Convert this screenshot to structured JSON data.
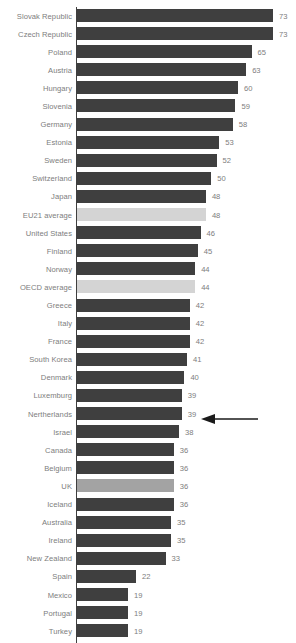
{
  "chart_data": {
    "type": "bar",
    "orientation": "horizontal",
    "title": "",
    "subtitle": "",
    "xlabel": "",
    "ylabel": "",
    "xlim": [
      0,
      73
    ],
    "grid": false,
    "legend": null,
    "categories": [
      "Slovak Republic",
      "Czech Republic",
      "Poland",
      "Austria",
      "Hungary",
      "Slovenia",
      "Germany",
      "Estonia",
      "Sweden",
      "Switzerland",
      "Japan",
      "EU21 average",
      "United States",
      "Finland",
      "Norway",
      "OECD average",
      "Greece",
      "Italy",
      "France",
      "South Korea",
      "Denmark",
      "Luxemburg",
      "Nertherlands",
      "Israel",
      "Canada",
      "Belgium",
      "UK",
      "Iceland",
      "Australia",
      "Ireland",
      "New Zealand",
      "Spain",
      "Mexico",
      "Portugal",
      "Turkey"
    ],
    "values": [
      73,
      73,
      65,
      63,
      60,
      59,
      58,
      53,
      52,
      50,
      48,
      48,
      46,
      45,
      44,
      44,
      42,
      42,
      42,
      41,
      40,
      39,
      39,
      38,
      36,
      36,
      36,
      36,
      35,
      35,
      33,
      22,
      19,
      19,
      19
    ],
    "bar_styles": [
      "default",
      "default",
      "default",
      "default",
      "default",
      "default",
      "default",
      "default",
      "default",
      "default",
      "default",
      "average",
      "default",
      "default",
      "default",
      "average",
      "default",
      "default",
      "default",
      "default",
      "default",
      "default",
      "default",
      "default",
      "default",
      "default",
      "focus",
      "default",
      "default",
      "default",
      "default",
      "default",
      "default",
      "default",
      "default"
    ]
  },
  "colors": {
    "bar_default": "#3f3f3f",
    "bar_average": "#d4d4d4",
    "bar_focus": "#a3a3a3",
    "label_text": "#7d7d7d",
    "axis": "#3f3f3f",
    "arrow": "#1a1a1a",
    "background": "#ffffff"
  },
  "annotation": {
    "type": "arrow",
    "points_to": "UK",
    "direction": "left",
    "label": ""
  }
}
